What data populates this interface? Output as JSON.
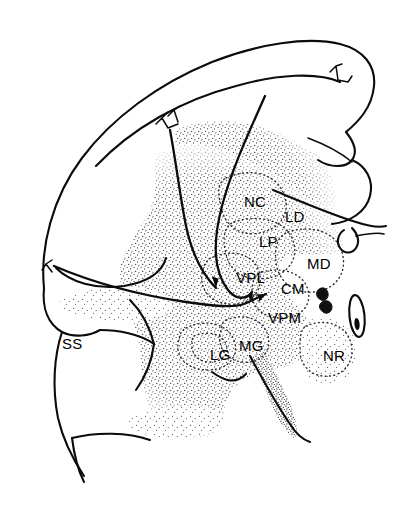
{
  "figure": {
    "type": "anatomical-line-drawing",
    "background_color": "#ffffff",
    "ink_color": "#0b0b0b",
    "width": 413,
    "height": 530
  },
  "labels": [
    {
      "id": "nc",
      "text": "NC",
      "x": 244,
      "y": 194,
      "meaning": "nucleus-caudatus"
    },
    {
      "id": "ld",
      "text": "LD",
      "x": 285,
      "y": 209,
      "meaning": "lateral-dorsal-nucleus"
    },
    {
      "id": "lp",
      "text": "LP",
      "x": 259,
      "y": 234,
      "meaning": "lateral-posterior-nucleus"
    },
    {
      "id": "md",
      "text": "MD",
      "x": 307,
      "y": 256,
      "meaning": "medial-dorsal-nucleus"
    },
    {
      "id": "vpl",
      "text": "VPL",
      "x": 236,
      "y": 270,
      "meaning": "ventral-posterolateral-nucleus"
    },
    {
      "id": "cm",
      "text": "CM",
      "x": 281,
      "y": 281,
      "meaning": "centromedian-nucleus"
    },
    {
      "id": "vpm",
      "text": "VPM",
      "x": 268,
      "y": 310,
      "meaning": "ventral-posteromedial-nucleus"
    },
    {
      "id": "mg",
      "text": "MG",
      "x": 239,
      "y": 338,
      "meaning": "medial-geniculate-nucleus"
    },
    {
      "id": "lg",
      "text": "LG",
      "x": 210,
      "y": 347,
      "meaning": "lateral-geniculate-nucleus"
    },
    {
      "id": "nr",
      "text": "NR",
      "x": 323,
      "y": 348,
      "meaning": "nucleus-ruber"
    },
    {
      "id": "ss",
      "text": "SS",
      "x": 62,
      "y": 336,
      "meaning": "suprasylvian-sulcus"
    }
  ],
  "pathways": [
    {
      "id": "tract-lateral",
      "target": "VPL",
      "description": "long lateral afferent tract curving from dorsolateral cortex into VPL"
    },
    {
      "id": "tract-medial",
      "target": "VPL",
      "description": "medial afferent tract descending beside the caudate into VPL"
    },
    {
      "id": "tract-ventral",
      "target": "VPM",
      "description": "ventral afferent tract sweeping below VPL and pointing into VPM"
    }
  ]
}
